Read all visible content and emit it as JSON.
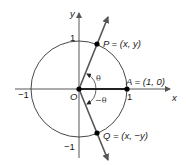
{
  "diagram": {
    "type": "unit-circle",
    "axes": {
      "x_label": "x",
      "y_label": "y",
      "ticks": {
        "x_neg": "−1",
        "x_pos": "1",
        "y_pos": "1",
        "y_neg": "−1"
      },
      "origin_label": "O"
    },
    "points": {
      "P": {
        "label": "P = (x, y)"
      },
      "A": {
        "label": "A = (1, 0)"
      },
      "Q": {
        "label": "Q = (x, −y)"
      }
    },
    "angles": {
      "positive": "θ",
      "negative": "−θ"
    },
    "colors": {
      "axis": "#333333",
      "circle": "#333333",
      "ray": "#555555",
      "point": "#000000"
    }
  }
}
